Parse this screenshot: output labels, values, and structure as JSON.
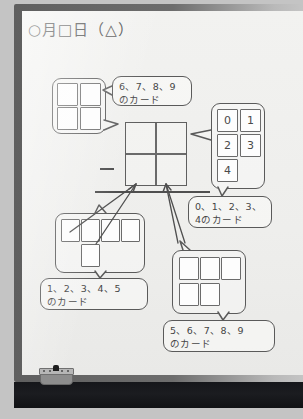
{
  "scene": {
    "name": "whiteboard-photo",
    "subject": "japanese-elementary-math-vertical-subtraction-with-digit-cards"
  },
  "board": {
    "title": "○月□日（△）",
    "frame_color": "#6d6d6d",
    "face_color": "#efefed",
    "ink_color": "#3b3b3b"
  },
  "tray": {
    "name": "marker-tray",
    "color": "#16171b",
    "eraser": {
      "name": "whiteboard-eraser",
      "body_color": "#8d8d8d"
    }
  },
  "calc": {
    "name": "vertical-subtraction-frame",
    "operator": "−",
    "columns": 2,
    "rows": 2,
    "has_answer_line": true
  },
  "card_groups": [
    {
      "id": "top-left-group",
      "layout": "2x2",
      "cards": [
        "",
        "",
        "",
        ""
      ],
      "label": "6、7、8、9\nのカード"
    },
    {
      "id": "right-group",
      "layout": "2-col-staggered",
      "cards": [
        "0",
        "1",
        "2",
        "3",
        "4"
      ],
      "label": "0、1、2、3、\n4のカード"
    },
    {
      "id": "bottom-left-group",
      "layout": "4-plus-1",
      "cards": [
        "",
        "",
        "",
        "",
        ""
      ],
      "label": "1、2、3、4、5\nのカード"
    },
    {
      "id": "bottom-right-group",
      "layout": "3-plus-2",
      "cards": [
        "",
        "",
        "",
        "",
        ""
      ],
      "label": "5、6、7、8、9\nのカード"
    }
  ],
  "bubbles": {
    "top": "6、7、8、9\nのカード",
    "right": "0、1、2、3、\n4のカード",
    "bottom_left": "1、2、3、4、5\nのカード",
    "bottom_right": "5、6、7、8、9\nのカード"
  }
}
